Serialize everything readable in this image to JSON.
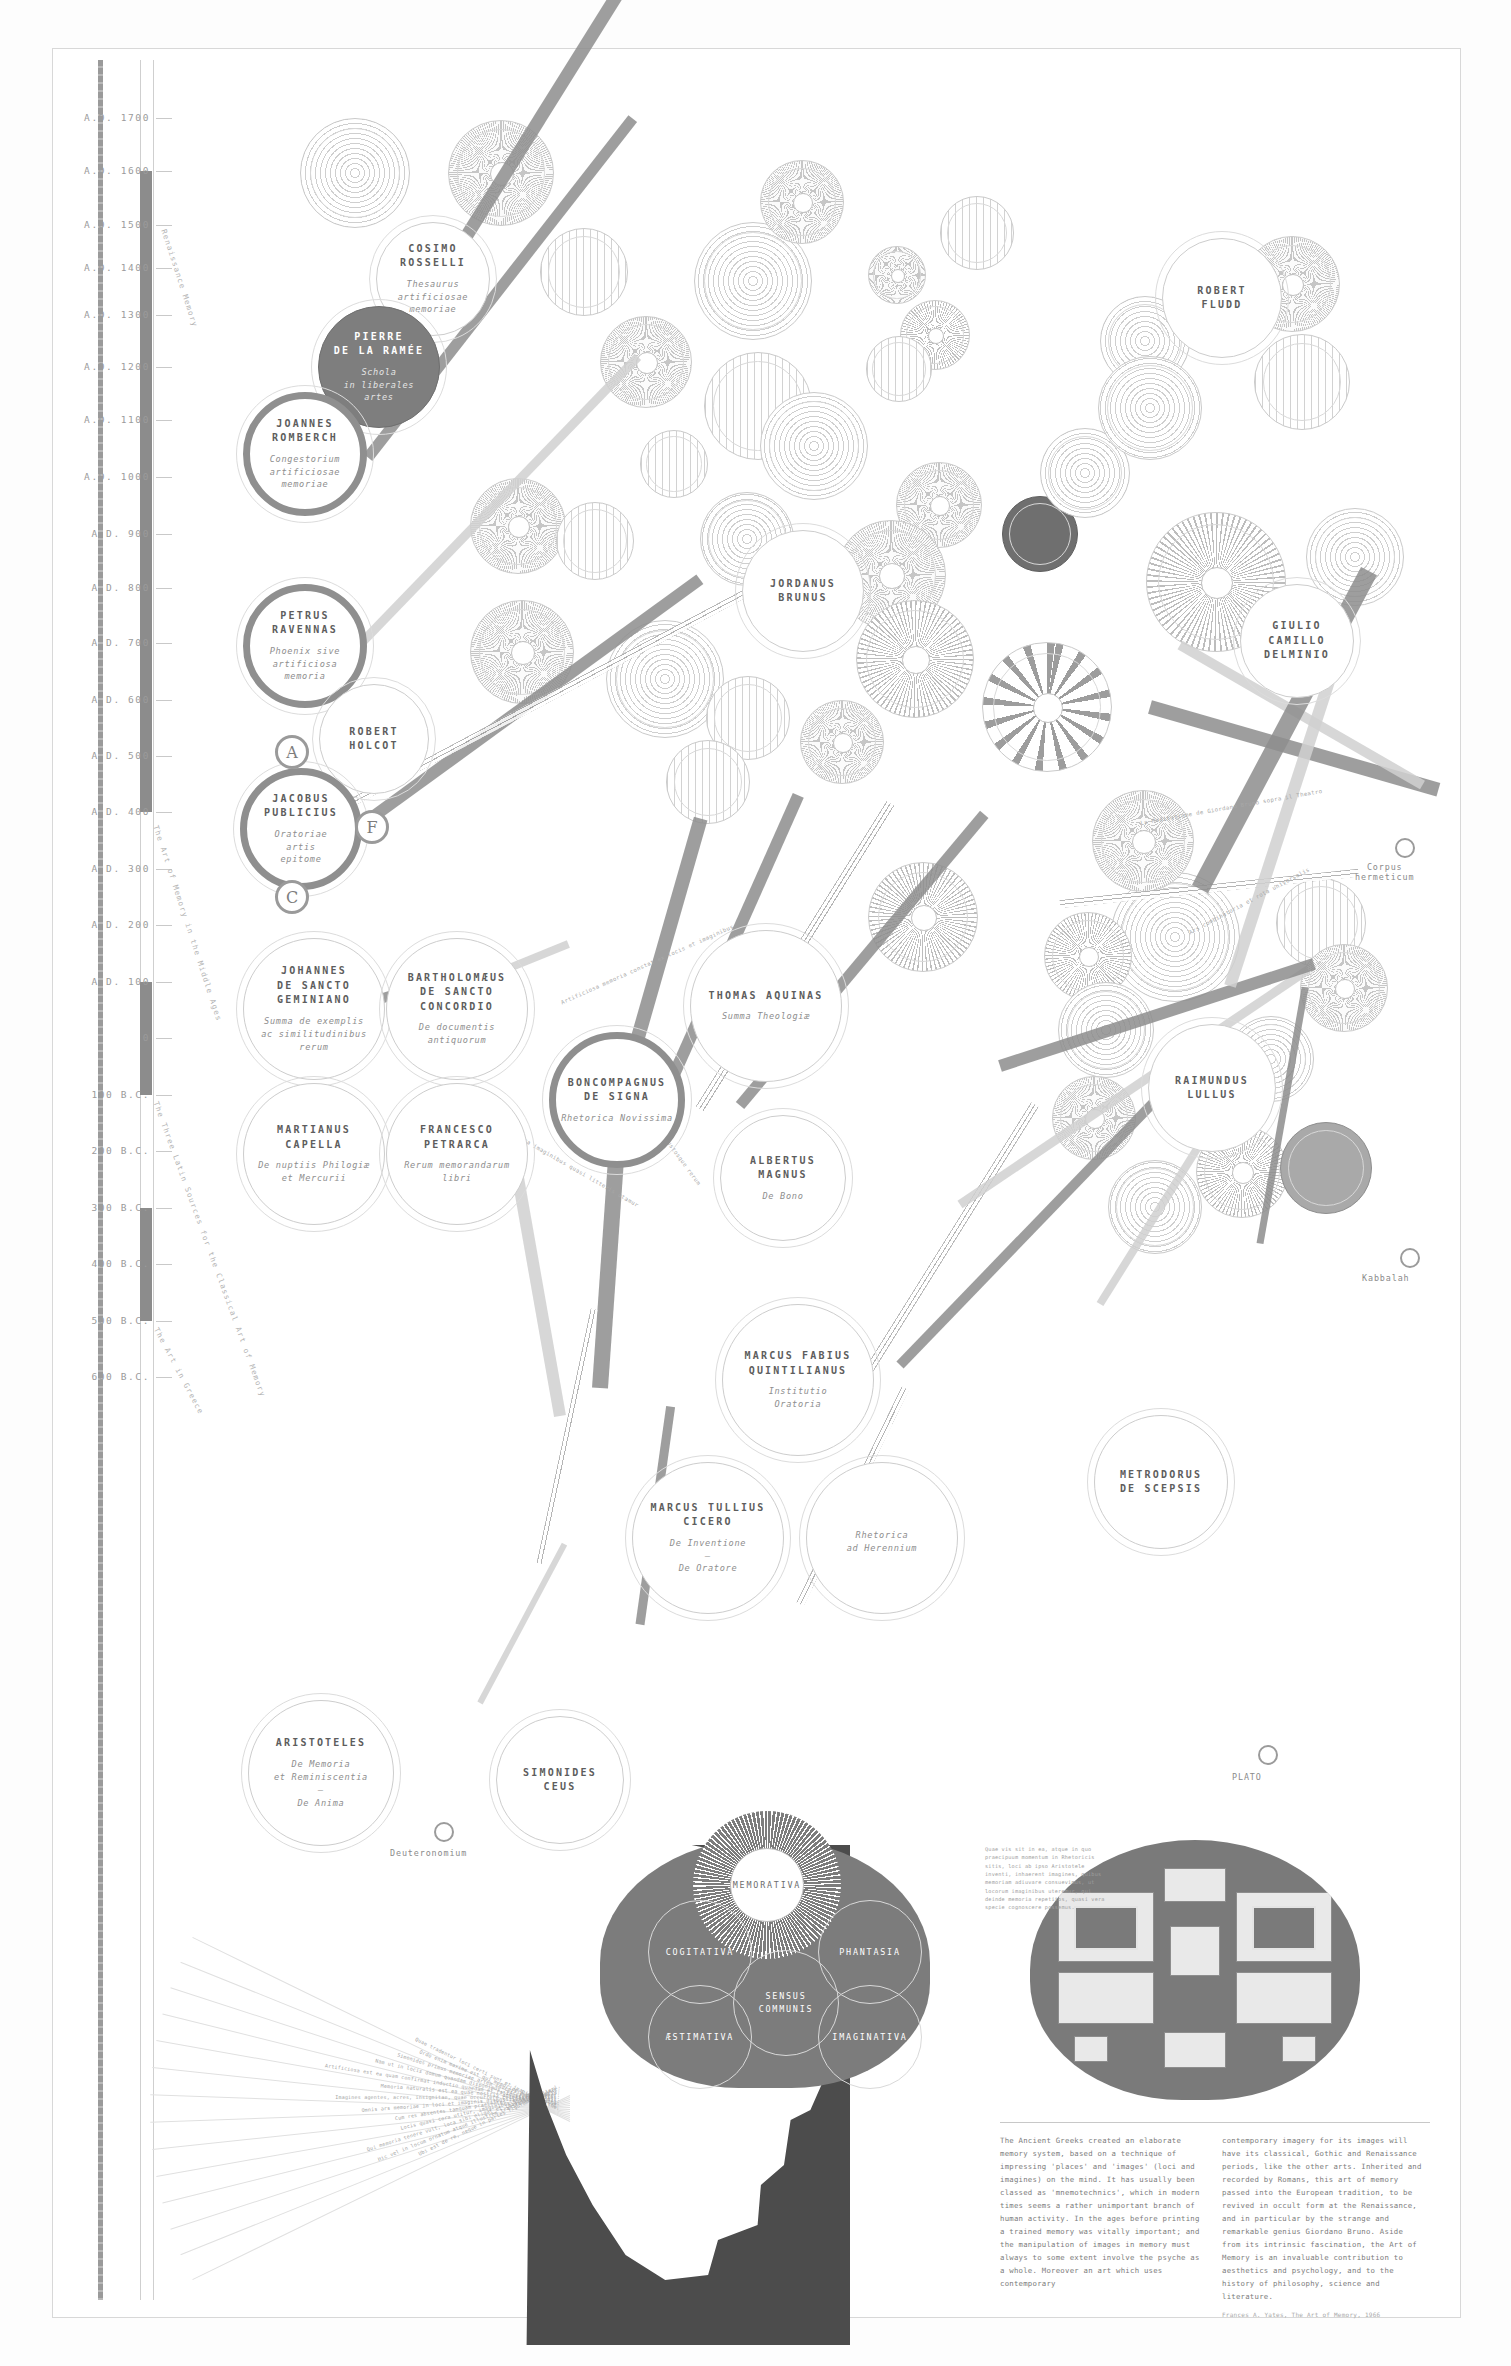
{
  "meta": {
    "title": "The Art of Memory",
    "subtitle": "A visual genealogy of the classical mnemonic tradition"
  },
  "timeline": {
    "ticks": [
      {
        "label": "A.D. 1700",
        "y": 118
      },
      {
        "label": "A.D. 1600",
        "y": 171
      },
      {
        "label": "A.D. 1500",
        "y": 225
      },
      {
        "label": "A.D. 1400",
        "y": 268
      },
      {
        "label": "A.D. 1300",
        "y": 315
      },
      {
        "label": "A.D. 1200",
        "y": 367
      },
      {
        "label": "A.D. 1100",
        "y": 420
      },
      {
        "label": "A.D. 1000",
        "y": 477
      },
      {
        "label": "A.D. 900",
        "y": 534
      },
      {
        "label": "A.D. 800",
        "y": 588
      },
      {
        "label": "A.D. 700",
        "y": 643
      },
      {
        "label": "A.D. 600",
        "y": 700
      },
      {
        "label": "A.D. 500",
        "y": 756
      },
      {
        "label": "A.D. 400",
        "y": 812
      },
      {
        "label": "A.D. 300",
        "y": 869
      },
      {
        "label": "A.D. 200",
        "y": 925
      },
      {
        "label": "A.D. 100",
        "y": 982
      },
      {
        "label": "0",
        "y": 1038
      },
      {
        "label": "100 B.C.",
        "y": 1095
      },
      {
        "label": "200 B.C.",
        "y": 1151
      },
      {
        "label": "300 B.C.",
        "y": 1208
      },
      {
        "label": "400 B.C.",
        "y": 1264
      },
      {
        "label": "500 B.C.",
        "y": 1321
      },
      {
        "label": "600 B.C.",
        "y": 1377
      }
    ],
    "era_labels": [
      {
        "text": "Renaissance Memory",
        "x": 168,
        "y": 228,
        "rot": 72
      },
      {
        "text": "The Art of Memory in the Middle Ages",
        "x": 160,
        "y": 824,
        "rot": 72
      },
      {
        "text": "The Three Latin Sources for the Classical Art of Memory",
        "x": 160,
        "y": 1100,
        "rot": 70
      },
      {
        "text": "The Art in Greece",
        "x": 160,
        "y": 1326,
        "rot": 62
      }
    ]
  },
  "nodes": [
    {
      "id": "cosimo-rosselli",
      "name": "COSIMO\nROSSELLI",
      "work": "Thesaurus\nartificiosae\nmemoriae",
      "x": 376,
      "y": 222,
      "d": 114,
      "style": "thin"
    },
    {
      "id": "pierre-de-la-ramee",
      "name": "PIERRE\nDE LA RAMÉE",
      "work": "Schola\nin liberales\nartes",
      "x": 318,
      "y": 306,
      "d": 122,
      "style": "dark"
    },
    {
      "id": "joannes-romberch",
      "name": "JOANNES\nROMBERCH",
      "work": "Congestorium\nartificiosae\nmemoriae",
      "x": 243,
      "y": 392,
      "d": 124,
      "style": "ring"
    },
    {
      "id": "petrus-ravennas",
      "name": "PETRUS\nRAVENNAS",
      "work": "Phoenix sive\nartificiosa\nmemoria",
      "x": 243,
      "y": 584,
      "d": 124,
      "style": "ring"
    },
    {
      "id": "robert-holcot",
      "name": "ROBERT\nHOLCOT",
      "work": "",
      "x": 319,
      "y": 684,
      "d": 110,
      "style": "thin"
    },
    {
      "id": "jacobus-publicius",
      "name": "JACOBUS\nPUBLICIUS",
      "work": "Oratoriae\nartis\nepitome",
      "x": 240,
      "y": 768,
      "d": 122,
      "style": "ring"
    },
    {
      "id": "johannes-de-sancto-geminiano",
      "name": "JOHANNES\nDE SANCTO\nGEMINIANO",
      "work": "Summa de exemplis\nac similitudinibus\nrerum",
      "x": 243,
      "y": 938,
      "d": 142,
      "style": "thin"
    },
    {
      "id": "bartholomaeus-de-sancto-concordio",
      "name": "BARTHOLOMÆUS\nDE SANCTO\nCONCORDIO",
      "work": "De documentis\nantiquorum",
      "x": 386,
      "y": 938,
      "d": 142,
      "style": "thin"
    },
    {
      "id": "martianus-capella",
      "name": "MARTIANUS\nCAPELLA",
      "work": "De nuptiis Philogiæ\net Mercurii",
      "x": 243,
      "y": 1083,
      "d": 142,
      "style": "thin"
    },
    {
      "id": "francesco-petrarca",
      "name": "FRANCESCO\nPETRARCA",
      "work": "Rerum memorandarum\nlibri",
      "x": 386,
      "y": 1083,
      "d": 142,
      "style": "thin"
    },
    {
      "id": "boncompagnus-de-signa",
      "name": "BONCOMPAGNUS\nDE SIGNA",
      "work": "Rhetorica Novissima",
      "x": 549,
      "y": 1032,
      "d": 136,
      "style": "ring"
    },
    {
      "id": "thomas-aquinas",
      "name": "THOMAS AQUINAS",
      "work": "Summa Theologiæ",
      "x": 690,
      "y": 930,
      "d": 152,
      "style": "thin"
    },
    {
      "id": "albertus-magnus",
      "name": "ALBERTUS\nMAGNUS",
      "work": "De Bono",
      "x": 720,
      "y": 1115,
      "d": 126,
      "style": "thin"
    },
    {
      "id": "marcus-fabius-quintilianus",
      "name": "MARCUS FABIUS\nQUINTILIANUS",
      "work": "Institutio\nOratoria",
      "x": 722,
      "y": 1304,
      "d": 152,
      "style": "thin"
    },
    {
      "id": "marcus-tullius-cicero",
      "name": "MARCUS TULLIUS\nCICERO",
      "work": "De Inventione\n—\nDe Oratore",
      "x": 632,
      "y": 1462,
      "d": 152,
      "style": "thin"
    },
    {
      "id": "rhetorica-ad-herennium",
      "name": "",
      "work": "Rhetorica\nad Herennium",
      "x": 806,
      "y": 1462,
      "d": 152,
      "style": "thin"
    },
    {
      "id": "metrodorus-de-scepsis",
      "name": "METRODORUS\nDE SCEPSIS",
      "work": "",
      "x": 1094,
      "y": 1415,
      "d": 134,
      "style": "thin"
    },
    {
      "id": "aristoteles",
      "name": "ARISTOTELES",
      "work": "De Memoria\net Reminiscentia\n—\nDe Anima",
      "x": 248,
      "y": 1700,
      "d": 146,
      "style": "thin"
    },
    {
      "id": "simonides-ceus",
      "name": "SIMONIDES\nCEUS",
      "work": "",
      "x": 496,
      "y": 1716,
      "d": 128,
      "style": "thin"
    },
    {
      "id": "jordanus-brunus",
      "name": "JORDANUS\nBRUNUS",
      "work": "",
      "x": 742,
      "y": 530,
      "d": 122,
      "style": "thin"
    },
    {
      "id": "robert-fludd",
      "name": "ROBERT\nFLUDD",
      "work": "",
      "x": 1162,
      "y": 238,
      "d": 120,
      "style": "thin"
    },
    {
      "id": "giulio-camillo-delminio",
      "name": "GIULIO\nCAMILLO\nDELMINIO",
      "work": "",
      "x": 1240,
      "y": 584,
      "d": 114,
      "style": "thin"
    },
    {
      "id": "raimundus-lullus",
      "name": "RAIMUNDUS\nLULLUS",
      "work": "",
      "x": 1148,
      "y": 1024,
      "d": 128,
      "style": "thin"
    }
  ],
  "badges": [
    {
      "letter": "A",
      "x": 275,
      "y": 735
    },
    {
      "letter": "F",
      "x": 355,
      "y": 810
    },
    {
      "letter": "C",
      "x": 275,
      "y": 880
    }
  ],
  "endpoints": [
    {
      "label": "Corpus\nhermeticum",
      "x": 1395,
      "y": 838,
      "label_x": 1355,
      "label_y": 862
    },
    {
      "label": "Kabbalah",
      "x": 1400,
      "y": 1248,
      "label_x": 1362,
      "label_y": 1273
    },
    {
      "label": "PLATO",
      "x": 1258,
      "y": 1745,
      "label_x": 1232,
      "label_y": 1772
    },
    {
      "label": "Deuteronomium",
      "x": 434,
      "y": 1822,
      "label_x": 390,
      "label_y": 1848
    }
  ],
  "brain": {
    "ventricles": [
      {
        "label": "MEMORATIVA",
        "x": 730,
        "y": 1848,
        "d": 74,
        "top": true
      },
      {
        "label": "COGITATIVA",
        "x": 648,
        "y": 1900,
        "d": 104,
        "top": false
      },
      {
        "label": "PHANTASIA",
        "x": 818,
        "y": 1900,
        "d": 104,
        "top": false
      },
      {
        "label": "SENSUS\nCOMMUNIS",
        "x": 733,
        "y": 1950,
        "d": 106,
        "top": false
      },
      {
        "label": "ÆSTIMATIVA",
        "x": 648,
        "y": 1985,
        "d": 104,
        "top": false
      },
      {
        "label": "IMAGINATIVA",
        "x": 818,
        "y": 1985,
        "d": 104,
        "top": false
      }
    ]
  },
  "essay": {
    "col1": "The Ancient Greeks created an elaborate memory system, based on a technique of impressing 'places' and 'images' (loci and imagines) on the mind. It has usually been classed as 'mnemotechnics', which in modern times seems a rather unimportant branch of human activity. In the ages before printing a trained memory was vitally important; and the manipulation of images in memory must always to some extent involve the psyche as a whole. Moreover an art which uses contemporary",
    "col2": "contemporary imagery for its images will have its classical, Gothic and Renaissance periods, like the other arts. Inherited and recorded by Romans, this art of memory passed into the European tradition, to be revived in occult form at the Renaissance, and in particular by the strange and remarkable genius Giordano Bruno. Aside from its intrinsic fascination, the Art of Memory is an invaluable contribution to aesthetics and psychology, and to the history of philosophy, science and literature.",
    "source": "Frances A. Yates, The Art of Memory, 1966"
  },
  "latin_block": "Quae vis sit in ea, atque in quo praecipuum momentum in Rhetoricis sitis, loci ab ipso Aristotele inventi, inhaerent imagines, quibus memoriam adiuvare consuevimus, ut locorum imaginibus uteremur, qui deinde memoria repetitos, quasi vera specie cognoscere possemus.",
  "fan_lines": [
    "Ubi est de re, neque in partes figuram intellexi.",
    "Hic vel in locum ornatum atque illustrem transferre convenit.",
    "Qui memoria tenere vult, loca sibi eligat et imagines collocet.",
    "Locis quasi cera utitur, imaginibus quasi litteris.",
    "Cum res absentes tamquam praesentes cernere videmur.",
    "Omnis ars memoriae in loci et imaginis dispositione consistit.",
    "Imagines agentes, acres, insignitae, quae occurrere celeriter possint.",
    "Memoria naturalis est ea quae nostris animis insita est.",
    "Artificiosa est ea quam confirmat inductio quaedam et ratio praeceptionis.",
    "Nam ut in locis domum quandam disponimus, sic in animo res.",
    "Simonides primus memoriae artem invenisse perhibetur.",
    "Ordo enim maxime est qui memoriae lumen affert.",
    "Quae tradentur loci certi sunt et imagines certae."
  ],
  "circular_texts": [
    {
      "text": "Artificiosa memoria constat ex locis et imaginibus",
      "x": 560,
      "y": 1000,
      "rot": -24
    },
    {
      "text": "ut locis quasi cera imaginibus quasi litteris utamur",
      "x": 470,
      "y": 1105,
      "rot": 30
    },
    {
      "text": "Thesaurus eloquentiae custosque rerum",
      "x": 620,
      "y": 1070,
      "rot": 54
    },
    {
      "text": "La Meditatione de Giordano Bruno sopra il Theatro",
      "x": 1140,
      "y": 820,
      "rot": -10
    },
    {
      "text": "Ars combinatoria et rota universalis",
      "x": 1188,
      "y": 930,
      "rot": -28
    }
  ],
  "colors": {
    "ink": "#6e6e6e",
    "dark_fill": "#7e7e7e",
    "rule": "#c9c9c9",
    "paper": "#ffffff"
  }
}
